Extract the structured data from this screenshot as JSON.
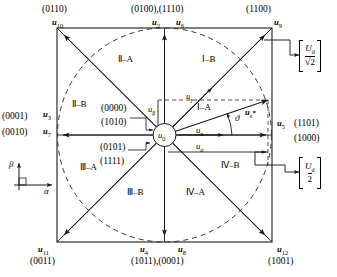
{
  "figure": {
    "type": "space-vector-diagram"
  },
  "vectors": {
    "center": {
      "name": "u0",
      "label": "u",
      "sub": "0"
    },
    "top_left": {
      "label": "u",
      "sub": "10",
      "code": "(0110)"
    },
    "top_right": {
      "label": "u",
      "sub": "9",
      "code": "(1100)"
    },
    "bottom_left": {
      "label": "u",
      "sub": "11",
      "code": "(0011)"
    },
    "bottom_right": {
      "label": "u",
      "sub": "12",
      "code": "(1001)"
    },
    "top_a": {
      "label": "u",
      "sub": "2"
    },
    "top_b": {
      "label": "u",
      "sub": "6"
    },
    "top_code": "(0100),(1110)",
    "bottom_a": {
      "label": "u",
      "sub": "4"
    },
    "bottom_b": {
      "label": "u",
      "sub": "8"
    },
    "bottom_code": "(1011),(0001)",
    "left_a": {
      "label": "u",
      "sub": "3",
      "code": "(0001)"
    },
    "left_b": {
      "label": "u",
      "sub": "7",
      "code": "(0010)"
    },
    "right": {
      "label": "u",
      "sub": "5",
      "code_1": "(1101)",
      "code_2": "(1000)"
    },
    "center_codes_upper": [
      "(0000)",
      "(1010)"
    ],
    "center_codes_lower": [
      "(0101)",
      "(1111)"
    ]
  },
  "components": {
    "u_beta": {
      "label": "u",
      "sub": "β"
    },
    "u_alpha": {
      "label": "u",
      "sub": "α"
    },
    "u_x": {
      "label": "u",
      "sub": "x"
    },
    "u_y": {
      "label": "u",
      "sub": "y"
    },
    "u_s_ref": {
      "label": "u",
      "sub": "s",
      "sup": "*"
    },
    "angle": "ϑ"
  },
  "sectors": [
    {
      "name": "I-A",
      "label": "Ⅰ–A"
    },
    {
      "name": "I-B",
      "label": "Ⅰ–B"
    },
    {
      "name": "II-A",
      "label": "Ⅱ–A"
    },
    {
      "name": "II-B",
      "label": "Ⅱ–B"
    },
    {
      "name": "III-A",
      "label": "Ⅲ–A"
    },
    {
      "name": "III-B",
      "label": "Ⅲ–B"
    },
    {
      "name": "IV-A",
      "label": "Ⅳ–A"
    },
    {
      "name": "IV-B",
      "label": "Ⅳ–B"
    }
  ],
  "annotations": {
    "radius_circle": {
      "numerator": "U",
      "numerator_sub": "d",
      "denominator": "√2"
    },
    "radius_half": {
      "numerator": "U",
      "numerator_sub": "d",
      "denominator": "2"
    }
  },
  "axes": {
    "vertical": "β",
    "horizontal": "α"
  },
  "colors": {
    "line": "#1a1a1a",
    "dashed": "#333333",
    "background": "#ffffff"
  }
}
